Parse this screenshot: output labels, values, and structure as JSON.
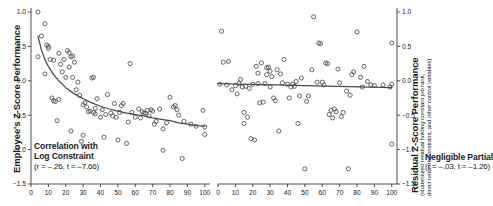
{
  "figure": {
    "panels": [
      {
        "id": "left",
        "y_axis_title": "Employee's Z-Score Performance",
        "annotation_line1": "Correlation with",
        "annotation_line2": "Log Constraint",
        "annotation_stats": "(r = –.26, t = –7.66)"
      },
      {
        "id": "right",
        "y_axis_title": "Residual Z-Score Performance",
        "y_axis_subtitle_line1": "(studentized residual holding constant job rank,",
        "y_axis_subtitle_line2": "direct network constraint, and other control variables)",
        "annotation_line1": "Negligible Partial",
        "annotation_stats": "(r = –.03, t = –1.26)"
      }
    ],
    "colors": {
      "axis": "#3d3d3d",
      "marker_stroke": "#4a4a4a",
      "fit_line": "#4a4a4a",
      "text": "#1a1a1a",
      "background": "#ffffff"
    }
  },
  "chart_data": [
    {
      "type": "scatter",
      "panel": "left",
      "title": "Correlation with Log Constraint",
      "xlabel": "",
      "ylabel": "Employee's Z-Score Performance",
      "xlim": [
        0,
        103
      ],
      "ylim": [
        -1.5,
        1.0
      ],
      "xticks": [
        0,
        10,
        20,
        30,
        40,
        50,
        60,
        70,
        80,
        90,
        100
      ],
      "yticks": [
        1.0,
        0.5,
        0.0,
        -0.5,
        -1.0,
        -1.5
      ],
      "ytick_labels": [
        "1.0",
        "0.5",
        "0.0",
        "−0.5",
        "−1.0",
        "−1.5"
      ],
      "grid": false,
      "legend": "none",
      "marker": "open-circle",
      "correlation_r": -0.26,
      "t_statistic": -7.66,
      "fit": {
        "kind": "logarithmic",
        "description": "descending log fit curve",
        "points": [
          [
            4,
            0.65
          ],
          [
            6,
            0.45
          ],
          [
            8,
            0.31
          ],
          [
            10,
            0.21
          ],
          [
            13,
            0.09
          ],
          [
            16,
            0.0
          ],
          [
            20,
            -0.1
          ],
          [
            25,
            -0.19
          ],
          [
            30,
            -0.26
          ],
          [
            35,
            -0.32
          ],
          [
            40,
            -0.37
          ],
          [
            45,
            -0.41
          ],
          [
            50,
            -0.44
          ],
          [
            55,
            -0.47
          ],
          [
            60,
            -0.49
          ],
          [
            65,
            -0.51
          ],
          [
            70,
            -0.54
          ],
          [
            75,
            -0.56
          ],
          [
            80,
            -0.58
          ],
          [
            85,
            -0.61
          ],
          [
            90,
            -0.63
          ],
          [
            95,
            -0.65
          ],
          [
            100,
            -0.66
          ]
        ]
      },
      "x": [
        4,
        4,
        6,
        8,
        8,
        9,
        10,
        10,
        11,
        12,
        13,
        13,
        14,
        15,
        16,
        16,
        17,
        18,
        19,
        20,
        21,
        22,
        22,
        23,
        23,
        24,
        24,
        25,
        26,
        27,
        28,
        29,
        30,
        30,
        31,
        32,
        33,
        34,
        35,
        36,
        36,
        37,
        37,
        38,
        40,
        41,
        42,
        43,
        44,
        46,
        47,
        48,
        49,
        50,
        51,
        52,
        53,
        55,
        56,
        57,
        58,
        60,
        62,
        63,
        64,
        65,
        66,
        67,
        68,
        69,
        70,
        71,
        72,
        74,
        76,
        76,
        78,
        80,
        82,
        83,
        84,
        85,
        87,
        88,
        92,
        95,
        99,
        100,
        100
      ],
      "y": [
        1.02,
        0.35,
        0.65,
        0.83,
        0.1,
        0.52,
        0.5,
        0.47,
        0.31,
        -0.25,
        -0.29,
        0.3,
        -0.3,
        -0.58,
        0.4,
        -0.27,
        0.24,
        0.13,
        0.31,
        0.05,
        0.44,
        0.41,
        0.2,
        0.35,
        -0.73,
        0.36,
        0.05,
        0.27,
        -0.13,
        -0.02,
        -0.21,
        -0.88,
        -0.35,
        -0.79,
        -0.32,
        -0.38,
        -0.45,
        -0.44,
        0.04,
        0.05,
        -0.46,
        -0.48,
        -0.4,
        -0.26,
        -0.53,
        -0.42,
        -0.82,
        -0.49,
        -0.2,
        -0.47,
        -0.51,
        -0.33,
        -0.53,
        -0.86,
        -0.46,
        -0.36,
        -0.33,
        -0.91,
        -0.6,
        0.25,
        -0.46,
        -0.53,
        -0.41,
        -0.54,
        -0.45,
        -0.47,
        -0.47,
        -0.43,
        -0.51,
        -0.42,
        -0.44,
        -0.63,
        -0.59,
        -0.41,
        -1.01,
        -0.7,
        -0.61,
        -0.24,
        -0.38,
        -0.36,
        -0.42,
        -0.5,
        -1.13,
        -0.59,
        -0.63,
        -0.66,
        -0.43,
        -0.67,
        -0.78
      ]
    },
    {
      "type": "scatter",
      "panel": "right",
      "title": "Negligible Partial",
      "xlabel": "",
      "ylabel": "Residual Z-Score Performance",
      "xlim": [
        0,
        103
      ],
      "ylim": [
        -1.5,
        1.0
      ],
      "xticks": [
        0,
        10,
        20,
        30,
        40,
        50,
        60,
        70,
        80,
        90,
        100
      ],
      "yticks": [
        1.0,
        0.5,
        0.0,
        -0.5,
        -1.0,
        -1.5
      ],
      "ytick_labels": [
        "1.0",
        "0.5",
        "0.0",
        "−0.5",
        "−1.0",
        "−1.5"
      ],
      "grid": false,
      "legend": "none",
      "marker": "open-circle",
      "correlation_r": -0.03,
      "t_statistic": -1.26,
      "fit": {
        "kind": "linear",
        "description": "near-flat regression line",
        "points": [
          [
            0,
            -0.04
          ],
          [
            100,
            -0.1
          ]
        ]
      },
      "x": [
        1,
        2,
        3,
        5,
        6,
        8,
        10,
        11,
        12,
        13,
        14,
        15,
        15,
        16,
        17,
        18,
        19,
        20,
        21,
        22,
        23,
        23,
        24,
        25,
        26,
        27,
        28,
        28,
        29,
        30,
        30,
        31,
        32,
        33,
        34,
        35,
        36,
        37,
        38,
        40,
        41,
        42,
        43,
        44,
        45,
        46,
        47,
        48,
        50,
        51,
        52,
        54,
        55,
        57,
        58,
        59,
        60,
        61,
        62,
        63,
        64,
        65,
        66,
        67,
        68,
        69,
        70,
        71,
        72,
        74,
        75,
        76,
        77,
        78,
        80,
        82,
        83,
        84,
        86,
        88,
        90,
        95,
        99,
        100,
        100,
        100
      ],
      "y": [
        -0.05,
        0.72,
        0.27,
        -0.06,
        0.28,
        -0.13,
        -0.07,
        -0.19,
        -0.04,
        0.02,
        -0.09,
        -0.62,
        -0.46,
        -0.08,
        -0.53,
        -0.11,
        -0.84,
        -0.05,
        -0.86,
        0.21,
        0.11,
        -0.04,
        -0.32,
        0.26,
        -0.31,
        -0.04,
        0.19,
        0.09,
        0.2,
        0.14,
        -0.09,
        0.06,
        -0.25,
        -0.29,
        0.16,
        -0.73,
        0.1,
        -0.03,
        0.31,
        -0.05,
        -0.25,
        -0.09,
        -0.05,
        -0.08,
        -0.01,
        -0.62,
        -0.22,
        0.04,
        -1.28,
        -0.3,
        -0.22,
        0.16,
        0.93,
        -0.02,
        0.55,
        0.54,
        -0.02,
        -0.06,
        0.26,
        0.25,
        -0.49,
        -0.43,
        -0.54,
        -0.41,
        -0.45,
        0.17,
        -0.03,
        -0.52,
        -0.46,
        -0.15,
        -1.28,
        -0.21,
        0.09,
        0.13,
        0.71,
        0.05,
        -0.09,
        0.21,
        -0.01,
        -0.06,
        -0.07,
        -0.06,
        -0.09,
        0.55,
        -0.05,
        -0.92
      ]
    }
  ]
}
